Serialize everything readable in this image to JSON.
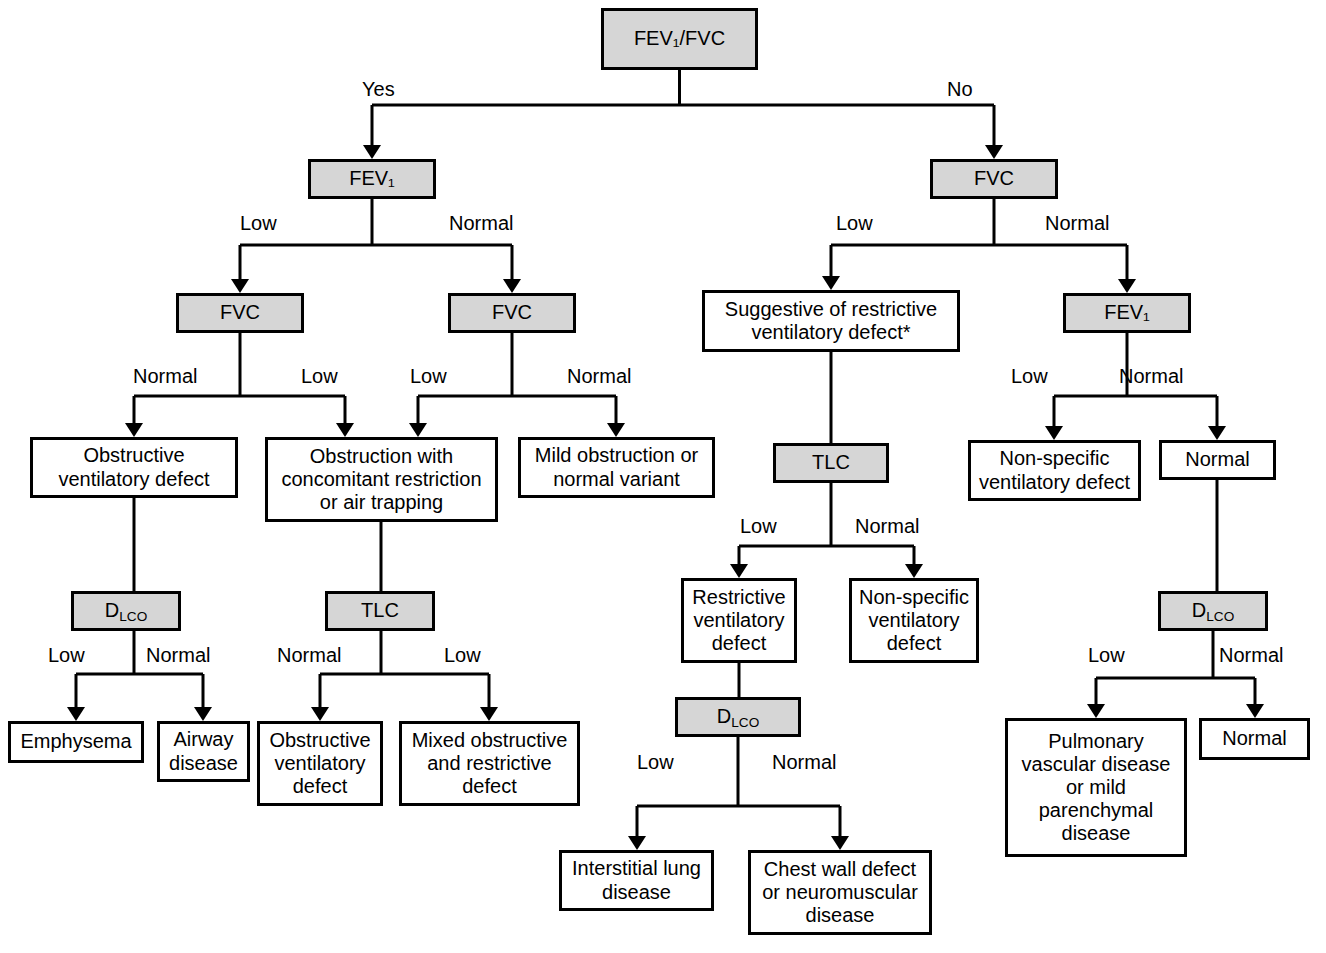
{
  "figure": {
    "type": "decision-tree-flowchart",
    "colors": {
      "decision_fill": "#d6d6d6",
      "outcome_fill": "#ffffff",
      "stroke": "#000000",
      "background": "#ffffff"
    }
  },
  "nodes": [
    {
      "id": "root",
      "kind": "decision",
      "lines": [
        "FEV₁/FVC",
        "<LLN or <0.70"
      ],
      "x": 601,
      "y": 8,
      "w": 157,
      "h": 62
    },
    {
      "id": "fev1_left",
      "kind": "decision",
      "lines": [
        "FEV₁"
      ],
      "x": 308,
      "y": 159,
      "w": 128,
      "h": 40
    },
    {
      "id": "fvc_right",
      "kind": "decision",
      "lines": [
        "FVC"
      ],
      "x": 930,
      "y": 159,
      "w": 128,
      "h": 40
    },
    {
      "id": "fvc_a",
      "kind": "decision",
      "lines": [
        "FVC"
      ],
      "x": 176,
      "y": 293,
      "w": 128,
      "h": 40
    },
    {
      "id": "fvc_b",
      "kind": "decision",
      "lines": [
        "FVC"
      ],
      "x": 448,
      "y": 293,
      "w": 128,
      "h": 40
    },
    {
      "id": "suggestive",
      "kind": "outcome",
      "lines": [
        "Suggestive of restrictive",
        "ventilatory defect*"
      ],
      "x": 702,
      "y": 290,
      "w": 258,
      "h": 62
    },
    {
      "id": "fev1_right",
      "kind": "decision",
      "lines": [
        "FEV₁"
      ],
      "x": 1063,
      "y": 293,
      "w": 128,
      "h": 40
    },
    {
      "id": "obstructive",
      "kind": "outcome",
      "lines": [
        "Obstructive",
        "ventilatory defect"
      ],
      "x": 30,
      "y": 437,
      "w": 208,
      "h": 61
    },
    {
      "id": "obstr_concom",
      "kind": "outcome",
      "lines": [
        "Obstruction with",
        "concomitant restriction",
        "or air trapping"
      ],
      "x": 265,
      "y": 437,
      "w": 233,
      "h": 85
    },
    {
      "id": "mild_obstr",
      "kind": "outcome",
      "lines": [
        "Mild obstruction or",
        "normal variant"
      ],
      "x": 518,
      "y": 437,
      "w": 197,
      "h": 61
    },
    {
      "id": "tlc_center",
      "kind": "decision",
      "lines": [
        "TLC"
      ],
      "x": 773,
      "y": 443,
      "w": 116,
      "h": 40
    },
    {
      "id": "nonspec_right",
      "kind": "outcome",
      "lines": [
        "Non-specific",
        "ventilatory defect"
      ],
      "x": 968,
      "y": 440,
      "w": 173,
      "h": 61
    },
    {
      "id": "normal_right",
      "kind": "outcome",
      "lines": [
        "Normal"
      ],
      "x": 1159,
      "y": 440,
      "w": 117,
      "h": 40
    },
    {
      "id": "dlco_left",
      "kind": "decision",
      "lines": [
        "D<sub>LCO</sub>"
      ],
      "x": 71,
      "y": 591,
      "w": 110,
      "h": 40
    },
    {
      "id": "tlc_left",
      "kind": "decision",
      "lines": [
        "TLC"
      ],
      "x": 325,
      "y": 591,
      "w": 110,
      "h": 40
    },
    {
      "id": "restrictive",
      "kind": "outcome",
      "lines": [
        "Restrictive",
        "ventilatory",
        "defect"
      ],
      "x": 681,
      "y": 578,
      "w": 116,
      "h": 85
    },
    {
      "id": "nonspec_cent",
      "kind": "outcome",
      "lines": [
        "Non-specific",
        "ventilatory",
        "defect"
      ],
      "x": 849,
      "y": 578,
      "w": 130,
      "h": 85
    },
    {
      "id": "dlco_right",
      "kind": "decision",
      "lines": [
        "D<sub>LCO</sub>"
      ],
      "x": 1158,
      "y": 591,
      "w": 110,
      "h": 40
    },
    {
      "id": "emphysema",
      "kind": "outcome",
      "lines": [
        "Emphysema"
      ],
      "x": 8,
      "y": 721,
      "w": 136,
      "h": 42
    },
    {
      "id": "airway",
      "kind": "outcome",
      "lines": [
        "Airway",
        "disease"
      ],
      "x": 157,
      "y": 721,
      "w": 93,
      "h": 61
    },
    {
      "id": "obstr_vent",
      "kind": "outcome",
      "lines": [
        "Obstructive",
        "ventilatory",
        "defect"
      ],
      "x": 257,
      "y": 721,
      "w": 126,
      "h": 85
    },
    {
      "id": "mixed",
      "kind": "outcome",
      "lines": [
        "Mixed obstructive",
        "and restrictive",
        "defect"
      ],
      "x": 399,
      "y": 721,
      "w": 181,
      "h": 85
    },
    {
      "id": "dlco_center",
      "kind": "decision",
      "lines": [
        "D<sub>LCO</sub>"
      ],
      "x": 675,
      "y": 697,
      "w": 126,
      "h": 40
    },
    {
      "id": "pulm_vasc",
      "kind": "outcome",
      "lines": [
        "Pulmonary",
        "vascular disease",
        "or mild",
        "parenchymal",
        "disease"
      ],
      "x": 1005,
      "y": 718,
      "w": 182,
      "h": 139
    },
    {
      "id": "normal_far",
      "kind": "outcome",
      "lines": [
        "Normal"
      ],
      "x": 1199,
      "y": 718,
      "w": 111,
      "h": 42
    },
    {
      "id": "interstitial",
      "kind": "outcome",
      "lines": [
        "Interstitial lung",
        "disease"
      ],
      "x": 559,
      "y": 850,
      "w": 155,
      "h": 61
    },
    {
      "id": "chest_wall",
      "kind": "outcome",
      "lines": [
        "Chest wall defect",
        "or neuromuscular",
        "disease"
      ],
      "x": 748,
      "y": 850,
      "w": 184,
      "h": 85
    }
  ],
  "edge_labels": [
    {
      "id": "lbl_yes",
      "text": "Yes",
      "x": 362,
      "y": 79
    },
    {
      "id": "lbl_no",
      "text": "No",
      "x": 947,
      "y": 79
    },
    {
      "id": "lbl_fev1l_low",
      "text": "Low",
      "x": 240,
      "y": 213
    },
    {
      "id": "lbl_fev1l_normal",
      "text": "Normal",
      "x": 449,
      "y": 213
    },
    {
      "id": "lbl_fvcr_low",
      "text": "Low",
      "x": 836,
      "y": 213
    },
    {
      "id": "lbl_fvcr_normal",
      "text": "Normal",
      "x": 1045,
      "y": 213
    },
    {
      "id": "lbl_fvca_normal",
      "text": "Normal",
      "x": 133,
      "y": 366
    },
    {
      "id": "lbl_fvca_low",
      "text": "Low",
      "x": 301,
      "y": 366
    },
    {
      "id": "lbl_fvcb_low",
      "text": "Low",
      "x": 410,
      "y": 366
    },
    {
      "id": "lbl_fvcb_normal",
      "text": "Normal",
      "x": 567,
      "y": 366
    },
    {
      "id": "lbl_fev1r_low",
      "text": "Low",
      "x": 1011,
      "y": 366
    },
    {
      "id": "lbl_fev1r_normal",
      "text": "Normal",
      "x": 1119,
      "y": 366
    },
    {
      "id": "lbl_tlcc_low",
      "text": "Low",
      "x": 740,
      "y": 516
    },
    {
      "id": "lbl_tlcc_normal",
      "text": "Normal",
      "x": 855,
      "y": 516
    },
    {
      "id": "lbl_dlcol_low",
      "text": "Low",
      "x": 48,
      "y": 645
    },
    {
      "id": "lbl_dlcol_normal",
      "text": "Normal",
      "x": 146,
      "y": 645
    },
    {
      "id": "lbl_tlcl_normal",
      "text": "Normal",
      "x": 277,
      "y": 645
    },
    {
      "id": "lbl_tlcl_low",
      "text": "Low",
      "x": 444,
      "y": 645
    },
    {
      "id": "lbl_dlcor_low",
      "text": "Low",
      "x": 1088,
      "y": 645
    },
    {
      "id": "lbl_dlcor_normal",
      "text": "Normal",
      "x": 1219,
      "y": 645
    },
    {
      "id": "lbl_dlcoc_low",
      "text": "Low",
      "x": 637,
      "y": 752
    },
    {
      "id": "lbl_dlcoc_normal",
      "text": "Normal",
      "x": 772,
      "y": 752
    }
  ],
  "edges": [
    {
      "id": "e_root_split",
      "from": "root",
      "to": "fev1_left,fvc_right",
      "path": "M679.5 70 L679.5 105 M372 105 L994 105 M372 105 L372 150 M994 105 L994 150",
      "arrows": [
        {
          "x": 372,
          "y": 159
        },
        {
          "x": 994,
          "y": 159
        }
      ]
    },
    {
      "id": "e_fev1l_split",
      "from": "fev1_left",
      "to": "fvc_a,fvc_b",
      "path": "M372 199 L372 245 M240 245 L512 245 M240 245 L240 284 M512 245 L512 284",
      "arrows": [
        {
          "x": 240,
          "y": 293
        },
        {
          "x": 512,
          "y": 293
        }
      ]
    },
    {
      "id": "e_fvcr_split",
      "from": "fvc_right",
      "to": "suggestive,fev1_right",
      "path": "M994 199 L994 245 M831 245 L1127 245 M831 245 L831 281 M1127 245 L1127 284",
      "arrows": [
        {
          "x": 831,
          "y": 290
        },
        {
          "x": 1127,
          "y": 293
        }
      ]
    },
    {
      "id": "e_fvca_split",
      "from": "fvc_a",
      "to": "obstructive,obstr_concom",
      "path": "M240 333 L240 396 M134 396 L345 396 M134 396 L134 428 M345 396 L345 428",
      "arrows": [
        {
          "x": 134,
          "y": 437
        },
        {
          "x": 345,
          "y": 437
        }
      ]
    },
    {
      "id": "e_fvcb_split",
      "from": "fvc_b",
      "to": "obstr_concom,mild_obstr",
      "path": "M512 333 L512 396 M418 396 L616 396 M418 396 L418 428 M616 396 L616 428",
      "arrows": [
        {
          "x": 418,
          "y": 437
        },
        {
          "x": 616,
          "y": 437
        }
      ]
    },
    {
      "id": "e_sugg_tlc",
      "from": "suggestive",
      "to": "tlc_center",
      "path": "M831 352 L831 443",
      "arrows": []
    },
    {
      "id": "e_fev1r_split",
      "from": "fev1_right",
      "to": "nonspec_right,normal_right",
      "path": "M1127 333 L1127 396 M1054 396 L1217 396 M1054 396 L1054 431 M1217 396 L1217 431",
      "arrows": [
        {
          "x": 1054,
          "y": 440
        },
        {
          "x": 1217,
          "y": 440
        }
      ]
    },
    {
      "id": "e_obstr_dlco",
      "from": "obstructive",
      "to": "dlco_left",
      "path": "M134 498 L134 591",
      "arrows": []
    },
    {
      "id": "e_concom_tlc",
      "from": "obstr_concom",
      "to": "tlc_left",
      "path": "M381 522 L381 591",
      "arrows": []
    },
    {
      "id": "e_tlcc_split",
      "from": "tlc_center",
      "to": "restrictive,nonspec_cent",
      "path": "M831 483 L831 546 M739 546 L914 546 M739 546 L739 569 M914 546 L914 569",
      "arrows": [
        {
          "x": 739,
          "y": 578
        },
        {
          "x": 914,
          "y": 578
        }
      ]
    },
    {
      "id": "e_normalr_dlco",
      "from": "normal_right",
      "to": "dlco_right",
      "path": "M1217 480 L1217 591",
      "arrows": []
    },
    {
      "id": "e_dlcol_split",
      "from": "dlco_left",
      "to": "emphysema,airway",
      "path": "M134 631 L134 674 M76 674 L203 674 M76 674 L76 712 M203 674 L203 712",
      "arrows": [
        {
          "x": 76,
          "y": 721
        },
        {
          "x": 203,
          "y": 721
        }
      ]
    },
    {
      "id": "e_tlcl_split",
      "from": "tlc_left",
      "to": "obstr_vent,mixed",
      "path": "M381 631 L381 674 M320 674 L489 674 M320 674 L320 712 M489 674 L489 712",
      "arrows": [
        {
          "x": 320,
          "y": 721
        },
        {
          "x": 489,
          "y": 721
        }
      ]
    },
    {
      "id": "e_restr_dlco",
      "from": "restrictive",
      "to": "dlco_center",
      "path": "M739 663 L739 697",
      "arrows": []
    },
    {
      "id": "e_dlcor_split",
      "from": "dlco_right",
      "to": "pulm_vasc,normal_far",
      "path": "M1213 631 L1213 678 M1096 678 L1255 678 M1096 678 L1096 709 M1255 678 L1255 709",
      "arrows": [
        {
          "x": 1096,
          "y": 718
        },
        {
          "x": 1255,
          "y": 718
        }
      ]
    },
    {
      "id": "e_dlcoc_split",
      "from": "dlco_center",
      "to": "interstitial,chest_wall",
      "path": "M738 737 L738 806 M637 806 L840 806 M637 806 L637 841 M840 806 L840 841",
      "arrows": [
        {
          "x": 637,
          "y": 850
        },
        {
          "x": 840,
          "y": 850
        }
      ]
    }
  ]
}
